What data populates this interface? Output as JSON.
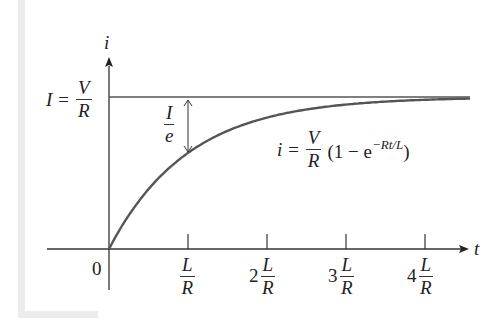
{
  "chart_data": {
    "type": "line",
    "title": "",
    "xlabel": "t",
    "ylabel": "i",
    "x_ticks": [
      {
        "coef": "",
        "num": "L",
        "den": "R"
      },
      {
        "coef": "2",
        "num": "L",
        "den": "R"
      },
      {
        "coef": "3",
        "num": "L",
        "den": "R"
      },
      {
        "coef": "4",
        "num": "L",
        "den": "R"
      }
    ],
    "origin_label": "0",
    "asymptote": {
      "lhs": "I =",
      "num": "V",
      "den": "R"
    },
    "gap_annotation": {
      "num": "I",
      "den": "e"
    },
    "equation": {
      "lhs": "i =",
      "num": "V",
      "den": "R",
      "open": "(1 − e",
      "exp": "−Rt/L",
      "close": ")"
    },
    "series": [
      {
        "name": "i(t)",
        "x_in_tau": [
          0,
          0.25,
          0.5,
          1,
          1.5,
          2,
          3,
          4,
          4.6
        ],
        "values_fraction_of_I": [
          0,
          0.221,
          0.393,
          0.632,
          0.777,
          0.865,
          0.95,
          0.982,
          0.99
        ]
      }
    ],
    "xlim_tau": [
      -0.8,
      4.7
    ],
    "ylim_fraction_of_I": [
      0,
      1.2
    ],
    "grid": false,
    "legend": "none"
  }
}
